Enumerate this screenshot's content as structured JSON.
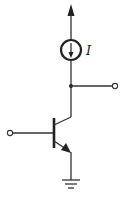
{
  "diagram": {
    "type": "circuit-schematic",
    "title": "",
    "components": [
      {
        "id": "supply-arrow",
        "kind": "supply-rail-arrow"
      },
      {
        "id": "current-source",
        "kind": "current-source",
        "label": "I",
        "direction": "down"
      },
      {
        "id": "output-node",
        "kind": "junction"
      },
      {
        "id": "output-terminal",
        "kind": "terminal"
      },
      {
        "id": "input-terminal",
        "kind": "terminal"
      },
      {
        "id": "transistor",
        "kind": "npn-bjt",
        "terminals": [
          "base",
          "collector",
          "emitter"
        ]
      },
      {
        "id": "ground",
        "kind": "ground"
      }
    ],
    "labels": {
      "current_source": "I"
    },
    "colors": {
      "line": "#333333",
      "background": "#ffffff"
    }
  }
}
